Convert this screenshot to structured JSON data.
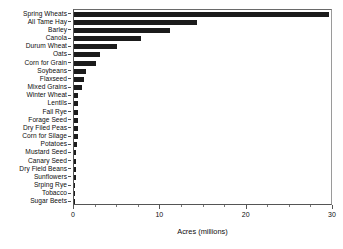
{
  "chart_data": {
    "type": "bar",
    "orientation": "horizontal",
    "title": "",
    "xlabel": "Acres (millions)",
    "ylabel": "",
    "xlim": [
      0,
      30
    ],
    "xticks": [
      0,
      10,
      20,
      30
    ],
    "xtick_labels": [
      "0",
      "10",
      "20",
      "30"
    ],
    "xminor_ticks": [
      2.5,
      5,
      7.5,
      12.5,
      15,
      17.5,
      22.5,
      25,
      27.5
    ],
    "grid": false,
    "legend": null,
    "bar_color": "#1b1b1b",
    "categories": [
      "Spring Wheats",
      "All Tame Hay",
      "Barley",
      "Canola",
      "Durum Wheat",
      "Oats",
      "Corn for Grain",
      "Soybeans",
      "Flaxseed",
      "Mixed Grains",
      "Winter Wheat",
      "Lentils",
      "Fall Rye",
      "Forage Seed",
      "Dry Filed Peas",
      "Corn for Silage",
      "Potatoes",
      "Mustard Seed",
      "Canary Seed",
      "Dry Field Beans",
      "Sunflowers",
      "Srping Rye",
      "Tobacco",
      "Sugar Beets"
    ],
    "values": [
      29.5,
      14.3,
      11.1,
      7.8,
      5.0,
      3.0,
      2.6,
      1.4,
      1.2,
      0.95,
      0.5,
      0.45,
      0.45,
      0.42,
      0.42,
      0.42,
      0.3,
      0.28,
      0.28,
      0.25,
      0.22,
      0.1,
      0.06,
      0.05
    ]
  }
}
